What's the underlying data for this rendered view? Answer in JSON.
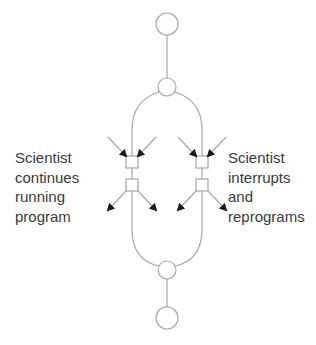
{
  "diagram": {
    "type": "branching-flow",
    "colors": {
      "line": "#a6a6a6",
      "arrow": "#1a1a1a",
      "text": "#3a3a3a",
      "background": "#ffffff"
    },
    "nodes": [
      {
        "id": "start",
        "shape": "circle",
        "role": "start-node"
      },
      {
        "id": "split",
        "shape": "circle",
        "role": "branch-split"
      },
      {
        "id": "merge",
        "shape": "circle",
        "role": "branch-merge"
      },
      {
        "id": "end",
        "shape": "circle",
        "role": "end-node"
      }
    ],
    "branches": [
      {
        "side": "left",
        "label_lines": [
          "Scientist",
          "continues",
          "running",
          "program"
        ]
      },
      {
        "side": "right",
        "label_lines": [
          "Scientist",
          "interrupts",
          "and",
          "reprograms"
        ]
      }
    ]
  }
}
